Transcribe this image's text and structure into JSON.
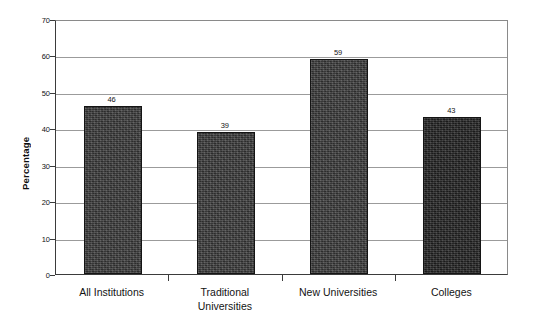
{
  "chart_data": {
    "type": "bar",
    "title": "",
    "xlabel": "",
    "ylabel": "Percentage",
    "categories": [
      "All Institutions",
      "Traditional\nUniversities",
      "New Universities",
      "Colleges"
    ],
    "values": [
      46,
      39,
      59,
      43
    ],
    "value_labels": [
      "46",
      "39",
      "59",
      "43"
    ],
    "ylim": [
      0,
      70
    ],
    "yticks": [
      0,
      10,
      20,
      30,
      40,
      50,
      60,
      70
    ],
    "ytick_labels": [
      "0",
      "10",
      "20",
      "30",
      "40",
      "50",
      "60",
      "70"
    ],
    "grid": true,
    "legend": "none",
    "series": [
      {
        "name": "Percentage",
        "values": [
          46,
          39,
          59,
          43
        ]
      }
    ],
    "colors": {
      "bar_fill": "#3c3c3c",
      "bar_fill_dark": "#232323",
      "bar_border": "#141414",
      "gridline": "#9b9b9b",
      "axis": "#3b3b3b",
      "text": "#131313",
      "background": "#ffffff"
    }
  }
}
